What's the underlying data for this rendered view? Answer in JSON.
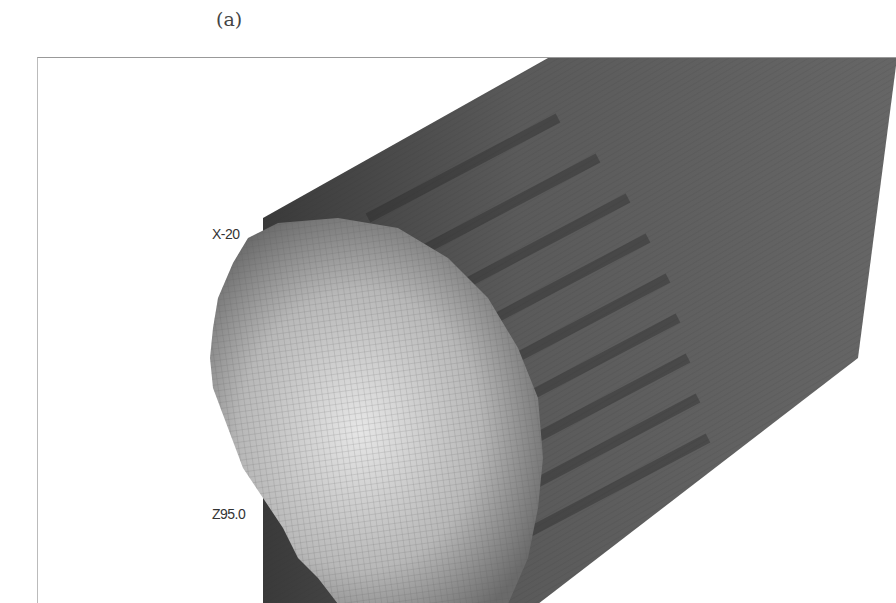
{
  "figure": {
    "panel_label": "(a)",
    "axis_labels": {
      "x_label": "X-20",
      "z_label": "Z95.0"
    },
    "colors": {
      "body_dark": "#4a4a4a",
      "face_light": "#d8d8d8",
      "frame_border": "#999999"
    }
  }
}
